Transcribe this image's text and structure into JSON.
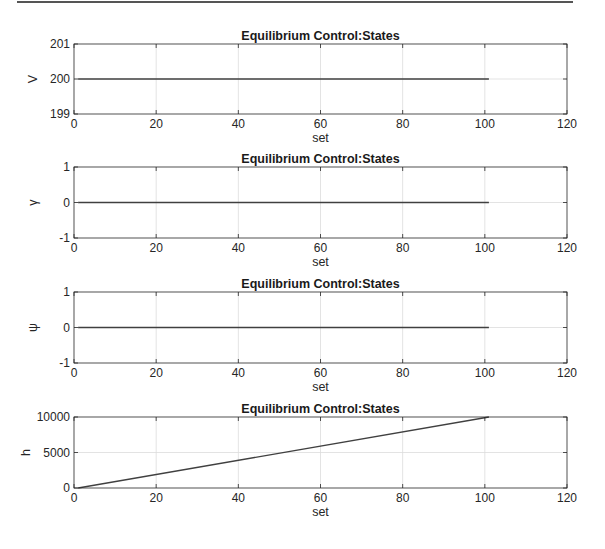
{
  "chart_data": [
    {
      "type": "line",
      "title": "Equilibrium Control:States",
      "xlabel": "set",
      "ylabel": "V",
      "xlim": [
        0,
        120
      ],
      "ylim": [
        199,
        201
      ],
      "xticks": [
        0,
        20,
        40,
        60,
        80,
        100,
        120
      ],
      "yticks": [
        199,
        200,
        201
      ],
      "grid": true,
      "series": [
        {
          "name": "V",
          "x": [
            1,
            101
          ],
          "values": [
            200,
            200
          ]
        }
      ]
    },
    {
      "type": "line",
      "title": "Equilibrium Control:States",
      "xlabel": "set",
      "ylabel": "γ",
      "xlim": [
        0,
        120
      ],
      "ylim": [
        -1,
        1
      ],
      "xticks": [
        0,
        20,
        40,
        60,
        80,
        100,
        120
      ],
      "yticks": [
        -1,
        0,
        1
      ],
      "grid": true,
      "series": [
        {
          "name": "gamma",
          "x": [
            1,
            101
          ],
          "values": [
            0,
            0
          ]
        }
      ]
    },
    {
      "type": "line",
      "title": "Equilibrium Control:States",
      "xlabel": "set",
      "ylabel": "ψ",
      "xlim": [
        0,
        120
      ],
      "ylim": [
        -1,
        1
      ],
      "xticks": [
        0,
        20,
        40,
        60,
        80,
        100,
        120
      ],
      "yticks": [
        -1,
        0,
        1
      ],
      "grid": true,
      "series": [
        {
          "name": "psi",
          "x": [
            1,
            101
          ],
          "values": [
            0,
            0
          ]
        }
      ]
    },
    {
      "type": "line",
      "title": "Equilibrium Control:States",
      "xlabel": "set",
      "ylabel": "h",
      "xlim": [
        0,
        120
      ],
      "ylim": [
        0,
        10000
      ],
      "xticks": [
        0,
        20,
        40,
        60,
        80,
        100,
        120
      ],
      "yticks": [
        0,
        5000,
        10000
      ],
      "grid": true,
      "series": [
        {
          "name": "h",
          "x": [
            1,
            101
          ],
          "values": [
            0,
            10000
          ]
        }
      ]
    }
  ],
  "colors": {
    "line": "#404040",
    "axis": "#262626",
    "grid": "#dcdcdc"
  }
}
